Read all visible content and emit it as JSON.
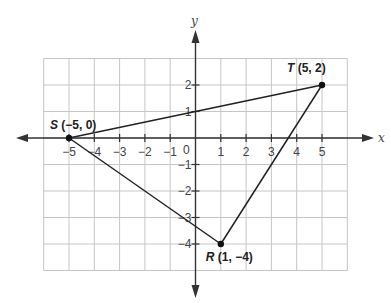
{
  "diagram": {
    "type": "coordinate-plane",
    "axes": {
      "x_label": "x",
      "y_label": "y",
      "origin_label": "0",
      "x_ticks": [
        "−5",
        "−4",
        "−3",
        "−2",
        "−1",
        "1",
        "2",
        "3",
        "4",
        "5"
      ],
      "x_tick_values": [
        -5,
        -4,
        -3,
        -2,
        -1,
        1,
        2,
        3,
        4,
        5
      ],
      "y_ticks": [
        "2",
        "1",
        "−1",
        "−2",
        "−3",
        "−4"
      ],
      "y_tick_values": [
        2,
        1,
        -1,
        -2,
        -3,
        -4
      ],
      "grid_x_range": [
        -6,
        6
      ],
      "grid_y_range": [
        -5,
        3
      ]
    },
    "points": [
      {
        "name": "S",
        "coords": "(−5, 0)",
        "x": -5,
        "y": 0
      },
      {
        "name": "T",
        "coords": "(5, 2)",
        "x": 5,
        "y": 2
      },
      {
        "name": "R",
        "coords": "(1, −4)",
        "x": 1,
        "y": -4
      }
    ],
    "segments": [
      [
        "S",
        "T"
      ],
      [
        "T",
        "R"
      ],
      [
        "R",
        "S"
      ]
    ],
    "colors": {
      "grid": "#c6c6c6",
      "axis": "#333333",
      "line": "#222222"
    }
  }
}
